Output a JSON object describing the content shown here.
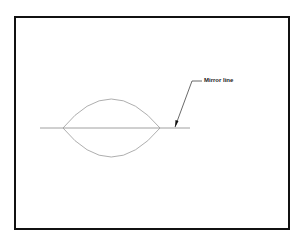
{
  "diagram": {
    "annotation": {
      "label": "Mirror line"
    },
    "colors": {
      "frame": "#111111",
      "stroke": "#888888",
      "leader": "#444444"
    }
  }
}
